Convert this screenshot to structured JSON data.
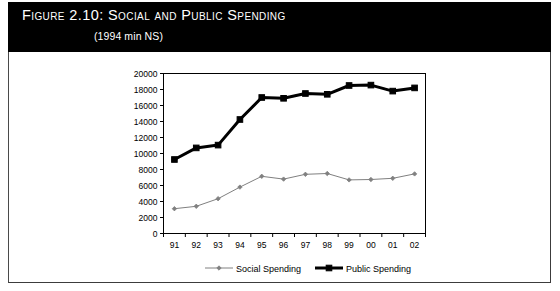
{
  "header": {
    "title": "Figure 2.10:  Social and Public Spending",
    "subtitle": "(1994 min NS)",
    "background_color": "#000000",
    "text_color": "#ffffff"
  },
  "chart_data": {
    "type": "line",
    "title": "Figure 2.10:  Social and Public Spending",
    "subtitle": "(1994 min NS)",
    "xlabel": "",
    "ylabel": "",
    "ylim": [
      0,
      20000
    ],
    "ytick_step": 2000,
    "grid": false,
    "legend_position": "bottom",
    "categories": [
      "91",
      "92",
      "93",
      "94",
      "95",
      "96",
      "97",
      "98",
      "99",
      "00",
      "01",
      "02"
    ],
    "yticks": [
      "0",
      "2000",
      "4000",
      "6000",
      "8000",
      "10000",
      "12000",
      "14000",
      "16000",
      "18000",
      "20000"
    ],
    "series": [
      {
        "name": "Social Spending",
        "color": "#808080",
        "line_width": 1,
        "marker": "diamond",
        "values": [
          3100,
          3400,
          4350,
          5800,
          7150,
          6800,
          7400,
          7500,
          6700,
          6750,
          6900,
          7450
        ]
      },
      {
        "name": "Public Spending",
        "color": "#000000",
        "line_width": 3,
        "marker": "square",
        "values": [
          9250,
          10700,
          11050,
          14250,
          17000,
          16900,
          17500,
          17400,
          18500,
          18550,
          17800,
          18200
        ]
      }
    ]
  },
  "legend": {
    "items": [
      {
        "label": "Social Spending",
        "color": "#808080"
      },
      {
        "label": "Public Spending",
        "color": "#000000"
      }
    ]
  }
}
